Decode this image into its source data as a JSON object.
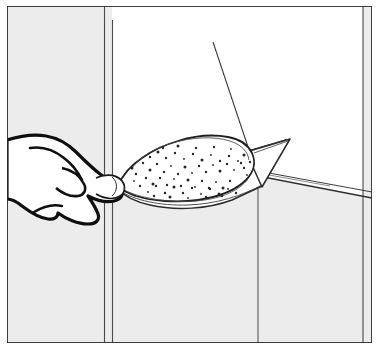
{
  "figure": {
    "type": "line-art-illustration",
    "title": "Applying plaster compound to a wall corner with a trowel",
    "subject": "hand-holding-trowel-applying-plaster",
    "style": "black ink line drawing with stipple texture, hand drawn",
    "width": 386,
    "height": 353,
    "background_color": "#ffffff"
  },
  "colors": {
    "ink": "#1a1a1a",
    "ink_thin": "#3d3d3d",
    "ink_hairline": "#5a5a5a",
    "wall_shadow": "#ececed",
    "wall_shadow_dark": "#e4e5e6",
    "paper": "#ffffff",
    "frame": "#2b2b2b"
  },
  "frame": {
    "name": "illustration-border",
    "top": 6,
    "left": 7,
    "right": 372,
    "bottom": 343,
    "stroke_width": 1.6
  },
  "scene": {
    "elements": [
      {
        "name": "wall-panel-left",
        "label": "Left wall panel in shadow",
        "tone": "#ececed"
      },
      {
        "name": "wall-panel-center",
        "label": "Center wall face, lit",
        "tone": "#ffffff"
      },
      {
        "name": "wall-panel-right",
        "label": "Right return wall in shadow",
        "tone": "#ececed"
      },
      {
        "name": "corner-seam-left",
        "label": "Vertical corner seam, left",
        "x": 104
      },
      {
        "name": "corner-seam-left-2",
        "label": "Vertical corner seam pair line",
        "x": 112
      },
      {
        "name": "corner-seam-center",
        "label": "Inside corner vertical line",
        "x": 258
      },
      {
        "name": "corner-seam-right",
        "label": "Right wall vertical seam",
        "x": 363
      },
      {
        "name": "ledge-edge",
        "label": "Horizontal ledge / top of lower wall",
        "y": 173
      },
      {
        "name": "hand",
        "label": "Hand gripping the trowel handle"
      },
      {
        "name": "trowel-blade",
        "label": "Trowel blade"
      },
      {
        "name": "trowel-tip",
        "label": "Pointed trowel tip"
      },
      {
        "name": "plaster-blob",
        "label": "Mound of plaster compound on the blade"
      },
      {
        "name": "stipple-texture",
        "label": "Stippled dots indicating rough plaster texture"
      },
      {
        "name": "guide-rod",
        "label": "Thin diagonal guide rod or wire"
      }
    ]
  },
  "geometry": {
    "guide_rod": {
      "x1": 213,
      "y1": 42,
      "x2": 248,
      "y2": 147
    },
    "ledge_y": 173,
    "corner_x": 258
  },
  "stipple_dots": [
    [
      150,
      170
    ],
    [
      157,
      164
    ],
    [
      164,
      172
    ],
    [
      171,
      166
    ],
    [
      178,
      174
    ],
    [
      185,
      167
    ],
    [
      192,
      173
    ],
    [
      199,
      166
    ],
    [
      206,
      172
    ],
    [
      213,
      165
    ],
    [
      220,
      171
    ],
    [
      227,
      164
    ],
    [
      234,
      170
    ],
    [
      241,
      163
    ],
    [
      146,
      178
    ],
    [
      153,
      184
    ],
    [
      160,
      178
    ],
    [
      167,
      185
    ],
    [
      174,
      179
    ],
    [
      181,
      186
    ],
    [
      188,
      180
    ],
    [
      195,
      187
    ],
    [
      202,
      181
    ],
    [
      209,
      188
    ],
    [
      216,
      182
    ],
    [
      223,
      188
    ],
    [
      230,
      181
    ],
    [
      237,
      187
    ],
    [
      143,
      163
    ],
    [
      150,
      157
    ],
    [
      158,
      152
    ],
    [
      166,
      158
    ],
    [
      175,
      153
    ],
    [
      184,
      159
    ],
    [
      193,
      154
    ],
    [
      202,
      160
    ],
    [
      211,
      155
    ],
    [
      220,
      161
    ],
    [
      229,
      156
    ],
    [
      238,
      161
    ],
    [
      244,
      155
    ],
    [
      140,
      186
    ],
    [
      148,
      192
    ],
    [
      156,
      186
    ],
    [
      165,
      193
    ],
    [
      174,
      187
    ],
    [
      183,
      193
    ],
    [
      192,
      188
    ],
    [
      201,
      194
    ],
    [
      210,
      189
    ],
    [
      219,
      194
    ],
    [
      228,
      189
    ],
    [
      236,
      193
    ],
    [
      136,
      174
    ],
    [
      134,
      181
    ],
    [
      132,
      168
    ],
    [
      244,
      168
    ],
    [
      247,
      175
    ],
    [
      250,
      162
    ],
    [
      163,
      148
    ],
    [
      178,
      146
    ],
    [
      196,
      148
    ],
    [
      214,
      147
    ],
    [
      231,
      149
    ],
    [
      154,
      196
    ],
    [
      170,
      197
    ],
    [
      188,
      198
    ],
    [
      206,
      197
    ],
    [
      222,
      196
    ]
  ]
}
